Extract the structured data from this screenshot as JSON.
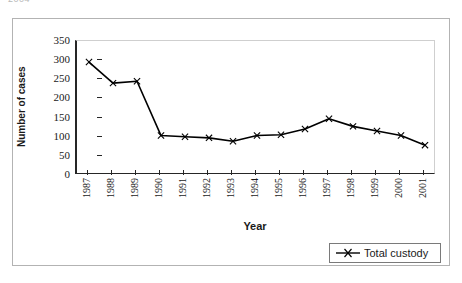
{
  "top_remnant": "2004",
  "chart_data": {
    "type": "line",
    "title": "",
    "xlabel": "Year",
    "ylabel": "Number of cases",
    "categories": [
      "1987",
      "1988",
      "1989",
      "1990",
      "1991",
      "1992",
      "1993",
      "1994",
      "1995",
      "1996",
      "1997",
      "1998",
      "1999",
      "2000",
      "2001"
    ],
    "series": [
      {
        "name": "Total custody",
        "marker": "x",
        "color": "#000000",
        "values": [
          295,
          240,
          245,
          103,
          100,
          97,
          88,
          103,
          105,
          120,
          147,
          127,
          115,
          103,
          78
        ]
      }
    ],
    "ylim": [
      0,
      350
    ],
    "yticks": [
      0,
      50,
      100,
      150,
      200,
      250,
      300,
      350
    ],
    "ytick_labels": [
      "0",
      "50",
      "100",
      "150",
      "200",
      "250",
      "300",
      "350"
    ],
    "grid": false,
    "legend_position": "bottom-right"
  },
  "legend": {
    "entries": [
      {
        "label": "Total custody",
        "marker": "x-marker-icon"
      }
    ]
  },
  "axes": {
    "x_title": "Year",
    "y_title": "Number of cases"
  }
}
